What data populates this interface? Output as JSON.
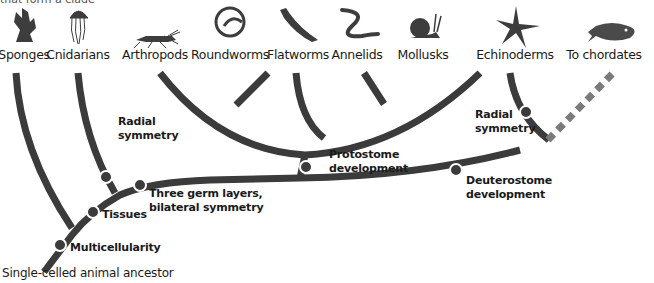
{
  "header": {
    "partial_title": "that form a clade"
  },
  "taxa": [
    {
      "label": "Sponges",
      "icon": "sponge-icon",
      "x": 24
    },
    {
      "label": "Cnidarians",
      "icon": "jellyfish-icon",
      "x": 78
    },
    {
      "label": "Arthropods",
      "icon": "grasshopper-icon",
      "x": 155
    },
    {
      "label": "Roundworms",
      "icon": "roundworm-icon",
      "x": 230
    },
    {
      "label": "Flatworms",
      "icon": "flatworm-icon",
      "x": 298
    },
    {
      "label": "Annelids",
      "icon": "annelid-icon",
      "x": 357
    },
    {
      "label": "Mollusks",
      "icon": "snail-icon",
      "x": 423
    },
    {
      "label": "Echinoderms",
      "icon": "starfish-icon",
      "x": 515
    },
    {
      "label": "To chordates",
      "icon": "fish-icon",
      "x": 604
    }
  ],
  "traits": [
    {
      "label_line1": "Radial",
      "label_line2": "symmetry",
      "x": 118,
      "y": 115
    },
    {
      "label_line1": "Three germ layers,",
      "label_line2": "bilateral symmetry",
      "x": 149,
      "y": 187
    },
    {
      "label_line1": "Tissues",
      "label_line2": "",
      "x": 102,
      "y": 208
    },
    {
      "label_line1": "Multicellularity",
      "label_line2": "",
      "x": 70,
      "y": 241
    },
    {
      "label_line1": "Protostome",
      "label_line2": "development",
      "x": 329,
      "y": 148
    },
    {
      "label_line1": "Deuterostome",
      "label_line2": "development",
      "x": 466,
      "y": 174
    },
    {
      "label_line1": "Radial",
      "label_line2": "symmetry",
      "x": 475,
      "y": 108
    }
  ],
  "root": {
    "label": "Single-celled animal ancestor"
  },
  "colors": {
    "branch": "#3b3b3b",
    "dot": "#3b3b3b",
    "dashed": "#7a7a7a",
    "icon": "#3d3d3d"
  }
}
